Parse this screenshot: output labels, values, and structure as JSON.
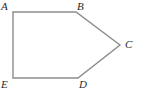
{
  "figure": {
    "name": "pentagon-abcde",
    "canvas": {
      "width": 143,
      "height": 94
    },
    "background_color": "#ffffff",
    "stroke_color": "#8c8c8c",
    "stroke_width": 1.4,
    "label_color": "#2b2b2b",
    "vertices": [
      {
        "id": "A",
        "label": "A",
        "x": 13,
        "y": 12,
        "label_x": 1,
        "label_y": 1
      },
      {
        "id": "B",
        "label": "B",
        "x": 76,
        "y": 12,
        "label_x": 77,
        "label_y": 1
      },
      {
        "id": "C",
        "label": "C",
        "x": 120,
        "y": 45,
        "label_x": 125,
        "label_y": 39
      },
      {
        "id": "D",
        "label": "D",
        "x": 78,
        "y": 78,
        "label_x": 79,
        "label_y": 79
      },
      {
        "id": "E",
        "label": "E",
        "x": 13,
        "y": 78,
        "label_x": 1,
        "label_y": 79
      }
    ],
    "edges": [
      {
        "id": "AB",
        "from": "A",
        "to": "B"
      },
      {
        "id": "BC",
        "from": "B",
        "to": "C"
      },
      {
        "id": "CD",
        "from": "C",
        "to": "D"
      },
      {
        "id": "DE",
        "from": "D",
        "to": "E"
      },
      {
        "id": "EA",
        "from": "E",
        "to": "A"
      }
    ],
    "path_points": "13,12 76,12 120,45 78,78 13,78"
  }
}
